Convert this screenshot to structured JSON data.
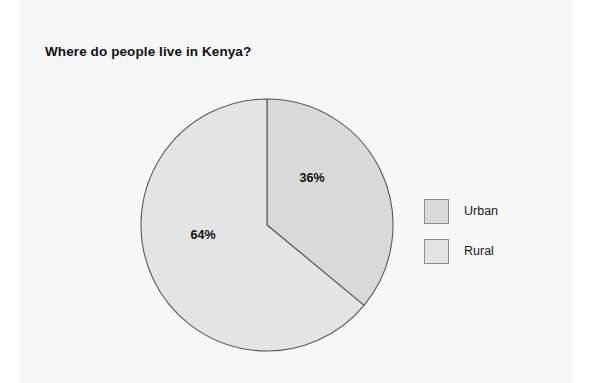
{
  "card": {
    "background": "#f7f7f7"
  },
  "chart_data": {
    "type": "pie",
    "title": "Where do people live in Kenya?",
    "xlabel": "",
    "ylabel": "",
    "categories": [
      "Urban",
      "Rural"
    ],
    "values": [
      36,
      64
    ],
    "value_labels": [
      "36%",
      "64%"
    ],
    "unit": "%",
    "colors": [
      "#d9d9d9",
      "#e4e4e4"
    ],
    "slice_border_color": "#595959",
    "start_angle_deg": 0,
    "direction": "clockwise",
    "legend_position": "right",
    "grid": false,
    "slices": [
      {
        "name": "Urban",
        "value": 36,
        "label": "36%",
        "color": "#d9d9d9",
        "start_deg": 0,
        "end_deg": 129.6,
        "label_x": 312,
        "label_y": 179
      },
      {
        "name": "Rural",
        "value": 64,
        "label": "64%",
        "color": "#e4e4e4",
        "start_deg": 129.6,
        "end_deg": 360,
        "label_x": 203,
        "label_y": 236
      }
    ]
  },
  "legend": {
    "items": [
      {
        "label": "Urban",
        "color": "#d9d9d9"
      },
      {
        "label": "Rural",
        "color": "#e4e4e4"
      }
    ]
  },
  "geometry": {
    "center_x": 127,
    "center_y": 127,
    "radius": 126
  }
}
